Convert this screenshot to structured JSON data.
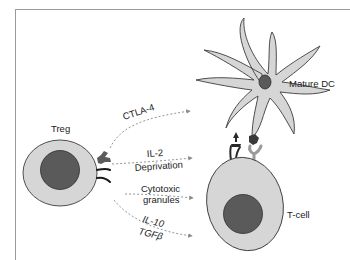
{
  "diagram": {
    "type": "biological-mechanism-schematic",
    "cells": {
      "treg": {
        "label": "Treg"
      },
      "mature_dc": {
        "label": "Mature DC"
      },
      "t_cell": {
        "label": "T-cell"
      }
    },
    "mechanisms": [
      {
        "id": "ctla4",
        "lines": [
          "CTLA-4"
        ],
        "target": "Mature DC"
      },
      {
        "id": "il2",
        "lines": [
          "IL-2",
          "Deprivation"
        ],
        "target": "T-cell"
      },
      {
        "id": "cytotoxic",
        "lines": [
          "Cytotoxic",
          "granules"
        ],
        "target": "T-cell"
      },
      {
        "id": "il10",
        "lines": [
          "IL-10",
          "TGFβ"
        ],
        "target": "T-cell"
      }
    ],
    "colors": {
      "cell_fill": "#d6d6d6",
      "nucleus_fill": "#5a5a5a",
      "outline": "#3c3c3c",
      "arrow": "#8a8a8a",
      "receptor_dark": "#2a2a2a",
      "receptor_light": "#9a9a9a"
    }
  }
}
